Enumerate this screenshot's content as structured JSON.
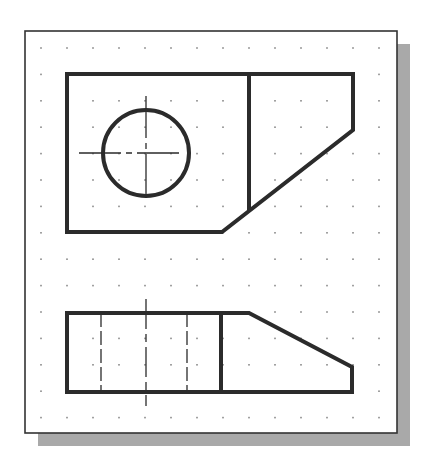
{
  "drawing": {
    "type": "cad-orthographic-views",
    "grid": {
      "x0": 41,
      "y0": 48,
      "dx": 26,
      "dy": 26.4,
      "cols": 14,
      "rows": 15,
      "dot_color": "#8a8a8a"
    },
    "frame": {
      "x": 25,
      "y": 31,
      "width": 372,
      "height": 402,
      "stroke": "#333333",
      "shadow_color": "#a9a9a9",
      "shadow_offset": 13
    },
    "line_color": "#2b2b2b",
    "top_view": {
      "outline": [
        [
          67,
          74
        ],
        [
          353,
          74
        ],
        [
          353,
          130
        ],
        [
          222,
          232
        ],
        [
          67,
          232
        ]
      ],
      "divider": [
        [
          249,
          74
        ],
        [
          249,
          211
        ]
      ],
      "hole": {
        "cx": 146,
        "cy": 153,
        "r": 43
      },
      "centerline_h": [
        [
          79,
          153
        ],
        [
          215,
          153
        ]
      ],
      "centerline_v": [
        [
          146,
          96
        ],
        [
          146,
          214
        ]
      ]
    },
    "front_view": {
      "outline": [
        [
          67,
          313
        ],
        [
          249,
          313
        ],
        [
          352,
          367
        ],
        [
          352,
          392
        ],
        [
          67,
          392
        ]
      ],
      "divider": [
        [
          221,
          313
        ],
        [
          221,
          392
        ]
      ],
      "hidden_lines": [
        [
          [
            101,
            313
          ],
          [
            101,
            392
          ]
        ],
        [
          [
            187,
            313
          ],
          [
            187,
            392
          ]
        ]
      ],
      "centerline_v": [
        [
          146,
          299
        ],
        [
          146,
          406
        ]
      ]
    }
  }
}
